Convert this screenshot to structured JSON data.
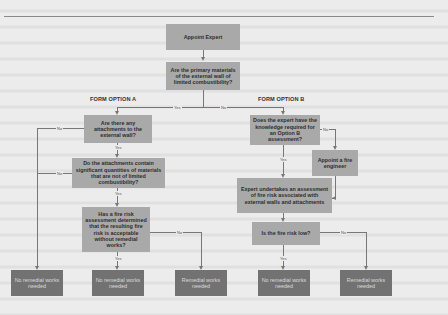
{
  "diagram": {
    "start": "Appoint Expert",
    "primary_question": "Are the primary materials of the external wall of limited combustibility?",
    "primary_yes": "Yes",
    "primary_no": "No",
    "option_a": {
      "heading": "FORM OPTION A",
      "q1": "Are there any attachments to the external wall?",
      "q1_yes": "Yes",
      "q1_no": "No",
      "q2": "Do the attachments contain significant quantities of materials that are not of limited combustibility?",
      "q2_yes": "Yes",
      "q2_no": "No",
      "q3": "Has a fire risk assessment determined that the resulting fire risk is acceptable without remedial works?",
      "q3_yes": "Yes",
      "q3_no": "No"
    },
    "option_b": {
      "heading": "FORM OPTION B",
      "q1": "Does the expert have the knowledge required for an Option B assessment?",
      "q1_yes": "Yes",
      "q1_no": "No",
      "appoint": "Appoint a fire engineer",
      "assess": "Expert undertakes an assessment of fire risk associated with external walls and attachments",
      "q2": "Is the fire risk low?",
      "q2_yes": "Yes",
      "q2_no": "No"
    },
    "outcomes": [
      "No remedial works needed",
      "No remedial works needed",
      "Remedial works needed",
      "No remedial works needed",
      "Remedial works needed"
    ]
  },
  "colors": {
    "decision_box": "#a9a9a9",
    "outcome_box": "#727272",
    "background": "#ececec",
    "connector": "#777777"
  }
}
